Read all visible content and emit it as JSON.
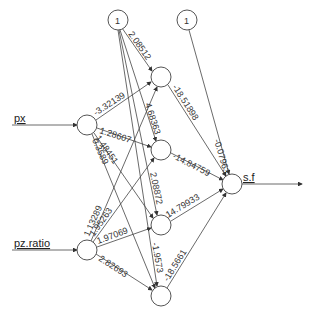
{
  "diagram": {
    "type": "neural-network",
    "nodes": {
      "bias1": {
        "label": "1",
        "x": 118,
        "y": 20
      },
      "bias2": {
        "label": "1",
        "x": 187,
        "y": 20
      },
      "px": {
        "label": "px",
        "x": 87,
        "y": 125
      },
      "pz": {
        "label": "pz.ratio",
        "x": 87,
        "y": 250
      },
      "h1": {
        "x": 161,
        "y": 77
      },
      "h2": {
        "x": 161,
        "y": 150
      },
      "h3": {
        "x": 161,
        "y": 225
      },
      "h4": {
        "x": 161,
        "y": 296
      },
      "out": {
        "label": "s.f",
        "x": 232,
        "y": 184
      }
    },
    "inputs": [
      {
        "label": "px"
      },
      {
        "label": "pz.ratio"
      }
    ],
    "output": {
      "label": "s.f"
    },
    "bias_labels": [
      "1",
      "1"
    ],
    "weights": {
      "b1_h1": "2.08512",
      "b1_h2": "4.68363",
      "b1_h3": "2.08872",
      "b1_h4": "-1.9573",
      "px_h1": "-3.32139",
      "px_h2": "1.28607",
      "px_h3": "1.48451",
      "px_h4": "0.3589",
      "pz_h1": "1.13289",
      "pz_h2": "1.95263",
      "pz_h3": "1.97069",
      "pz_h4": "2.82693",
      "h1_out": "-18.51898",
      "h2_out": "-14.84759",
      "h3_out": "14.79933",
      "h4_out": "-18.5661",
      "b2_out": "-0.07963"
    }
  }
}
